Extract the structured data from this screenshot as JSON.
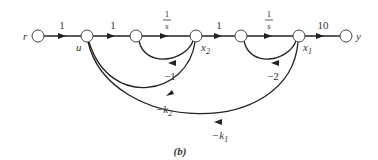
{
  "diagram": {
    "type": "signal-flow-graph",
    "caption": "(b)",
    "nodes": [
      {
        "id": "r",
        "label": "r"
      },
      {
        "id": "u",
        "label": "u"
      },
      {
        "id": "n3",
        "label": ""
      },
      {
        "id": "x2",
        "label": "x",
        "sub": "2"
      },
      {
        "id": "n5",
        "label": ""
      },
      {
        "id": "x1",
        "label": "x",
        "sub": "1"
      },
      {
        "id": "y",
        "label": "y"
      }
    ],
    "edges": [
      {
        "from": "r",
        "to": "u",
        "gain": "1"
      },
      {
        "from": "u",
        "to": "n3",
        "gain": "1"
      },
      {
        "from": "n3",
        "to": "x2",
        "gain_num": "1",
        "gain_den": "s"
      },
      {
        "from": "x2",
        "to": "n5",
        "gain": "1"
      },
      {
        "from": "n5",
        "to": "x1",
        "gain_num": "1",
        "gain_den": "s"
      },
      {
        "from": "x1",
        "to": "y",
        "gain": "10"
      },
      {
        "from": "x2",
        "to": "n3",
        "gain": "−1"
      },
      {
        "from": "x1",
        "to": "n5",
        "gain": "−2"
      },
      {
        "from": "x2",
        "to": "u",
        "gain_prefix": "−k",
        "gain_sub": "2"
      },
      {
        "from": "x1",
        "to": "u",
        "gain_prefix": "−k",
        "gain_sub": "1"
      }
    ]
  }
}
